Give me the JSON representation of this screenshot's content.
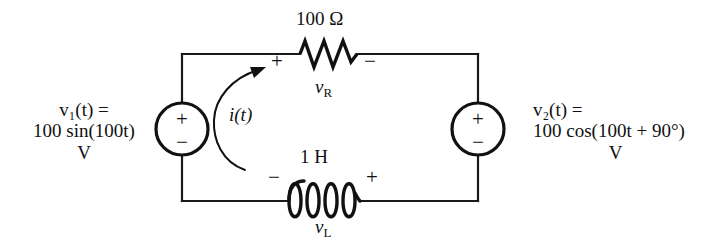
{
  "figure": {
    "type": "circuit-schematic"
  },
  "sources": {
    "left": {
      "name": "v1",
      "line1": "v₁(t) =",
      "line2": "100 sin(100t)",
      "line3": "V",
      "polarity_top": "+",
      "polarity_bottom": "−"
    },
    "right": {
      "name": "v2",
      "line1": "v₂(t) =",
      "line2": "100 cos(100t + 90°)",
      "line3": "V",
      "polarity_top": "+",
      "polarity_bottom": "−"
    }
  },
  "components": {
    "resistor": {
      "value": "100 Ω",
      "voltage_label": "v",
      "voltage_subscript": "R",
      "sign_left": "+",
      "sign_right": "−"
    },
    "inductor": {
      "value": "1 H",
      "voltage_label": "v",
      "voltage_subscript": "L",
      "sign_left": "−",
      "sign_right": "+"
    }
  },
  "current": {
    "label": "i(t)",
    "direction": "clockwise"
  },
  "colors": {
    "wire": "#1a1a1a",
    "text": "#111111",
    "background": "#ffffff"
  }
}
